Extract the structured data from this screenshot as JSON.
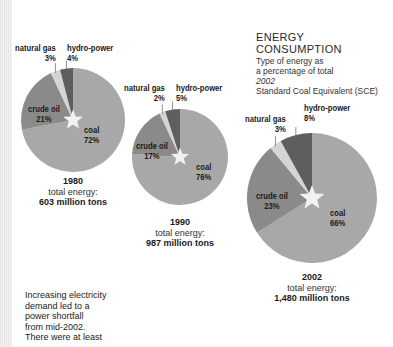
{
  "title": {
    "line1": "ENERGY",
    "line2": "CONSUMPTION",
    "sub1": "Type of energy as",
    "sub2": "a percentage of total",
    "sub3": "2002",
    "sub4": "Standard Coal Equivalent (SCE)"
  },
  "colors": {
    "coal": "#a8a8a8",
    "crude_oil": "#8a8a8a",
    "natural_gas": "#d4d4d4",
    "hydro_power": "#5e5e5e",
    "star": "#f2f2f2"
  },
  "pies": [
    {
      "year": "1980",
      "total_label": "total energy:",
      "total_value": "603 million tons",
      "labels": {
        "natural_gas": "natural gas",
        "natural_gas_pct": "3%",
        "hydro_power": "hydro-power",
        "hydro_power_pct": "4%",
        "crude_oil": "crude oil",
        "crude_oil_pct": "21%",
        "coal": "coal",
        "coal_pct": "72%"
      }
    },
    {
      "year": "1990",
      "total_label": "total energy:",
      "total_value": "987 million tons",
      "labels": {
        "natural_gas": "natural gas",
        "natural_gas_pct": "2%",
        "hydro_power": "hydro-power",
        "hydro_power_pct": "5%",
        "crude_oil": "crude oil",
        "crude_oil_pct": "17%",
        "coal": "coal",
        "coal_pct": "76%"
      }
    },
    {
      "year": "2002",
      "total_label": "total energy:",
      "total_value": "1,480 million tons",
      "labels": {
        "natural_gas": "natural gas",
        "natural_gas_pct": "3%",
        "hydro_power": "hydro-power",
        "hydro_power_pct": "8%",
        "crude_oil": "crude oil",
        "crude_oil_pct": "23%",
        "coal": "coal",
        "coal_pct": "66%"
      }
    }
  ],
  "note": {
    "line1": "Increasing electricity",
    "line2": "demand led to a",
    "line3": "power shortfall",
    "line4": "from mid-2002.",
    "line5": "There were at least"
  },
  "chart_data": [
    {
      "type": "pie",
      "title": "1980 — total energy: 603 million tons",
      "categories": [
        "coal",
        "crude oil",
        "natural gas",
        "hydro-power"
      ],
      "values": [
        72,
        21,
        3,
        4
      ],
      "unit": "%"
    },
    {
      "type": "pie",
      "title": "1990 — total energy: 987 million tons",
      "categories": [
        "coal",
        "crude oil",
        "natural gas",
        "hydro-power"
      ],
      "values": [
        76,
        17,
        2,
        5
      ],
      "unit": "%"
    },
    {
      "type": "pie",
      "title": "2002 — total energy: 1,480 million tons",
      "categories": [
        "coal",
        "crude oil",
        "natural gas",
        "hydro-power"
      ],
      "values": [
        66,
        23,
        3,
        8
      ],
      "unit": "%"
    }
  ]
}
